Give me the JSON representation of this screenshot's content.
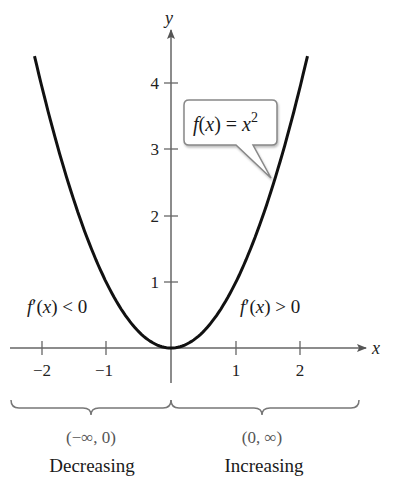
{
  "chart_data": {
    "type": "line",
    "title": "",
    "function_label": "f(x) = x²",
    "function_base": "f(x) = x",
    "function_exponent": "2",
    "xlabel": "x",
    "ylabel": "y",
    "xlim": [
      -2.5,
      2.9
    ],
    "ylim": [
      -0.5,
      4.6
    ],
    "x_ticks": [
      -2,
      -1,
      1,
      2
    ],
    "x_tick_labels": [
      "−2",
      "−1",
      "1",
      "2"
    ],
    "y_ticks": [
      1,
      2,
      3,
      4
    ],
    "y_tick_labels": [
      "1",
      "2",
      "3",
      "4"
    ],
    "grid": false,
    "series": [
      {
        "name": "f(x) = x^2",
        "x": [
          -2.1,
          -2,
          -1.5,
          -1,
          -0.5,
          0,
          0.5,
          1,
          1.5,
          2,
          2.1
        ],
        "y": [
          4.41,
          4,
          2.25,
          1,
          0.25,
          0,
          0.25,
          1,
          2.25,
          4,
          4.41
        ]
      }
    ],
    "annotations": {
      "left_derivative": "f′(x) < 0",
      "right_derivative": "f′(x) > 0",
      "left_interval": "(−∞, 0)",
      "right_interval": "(0, ∞)",
      "left_trend": "Decreasing",
      "right_trend": "Increasing"
    }
  }
}
